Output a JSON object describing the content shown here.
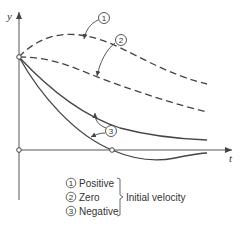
{
  "figure": {
    "axes": {
      "y_label": "y",
      "x_label": "t"
    },
    "curve_labels": {
      "c1": "1",
      "c2": "2",
      "c3": "3"
    },
    "legend": {
      "items": [
        {
          "num": "1",
          "label": "Positive"
        },
        {
          "num": "2",
          "label": "Zero"
        },
        {
          "num": "3",
          "label": "Negative"
        }
      ],
      "group_label": "Initial velocity"
    }
  }
}
